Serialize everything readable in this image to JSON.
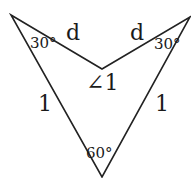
{
  "diagram": {
    "vertices": {
      "top_left": [
        11,
        15
      ],
      "top_right": [
        190,
        17
      ],
      "inner": [
        102,
        69
      ],
      "bottom": [
        102,
        177
      ]
    },
    "stroke_color": "#222222",
    "labels": {
      "angle_top_left": "30°",
      "angle_top_right": "30°",
      "angle_bottom": "60°",
      "angle_inner": "∠1",
      "side_left_top": "d",
      "side_right_top": "d",
      "side_left": "1",
      "side_right": "1"
    }
  }
}
